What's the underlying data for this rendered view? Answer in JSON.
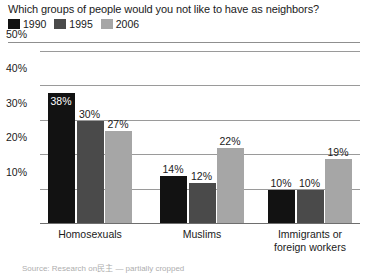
{
  "title": "Which groups of people would you not like to have as neighbors?",
  "legend": {
    "items": [
      {
        "label": "1990",
        "color": "#121212"
      },
      {
        "label": "1995",
        "color": "#4a4a4a"
      },
      {
        "label": "2006",
        "color": "#a6a6a6"
      }
    ]
  },
  "source_note": "Source: Research on民主 — partially cropped",
  "chart_data": {
    "type": "bar",
    "title": "Which groups of people would you not like to have as neighbors?",
    "xlabel": "",
    "ylabel": "",
    "ylim": [
      0,
      50
    ],
    "ytick_labels": [
      "10%",
      "20%",
      "30%",
      "40%",
      "50%"
    ],
    "ytick_values": [
      10,
      20,
      30,
      40,
      50
    ],
    "grid": true,
    "legend_position": "top-left",
    "categories": [
      "Homosexuals",
      "Muslims",
      "Immigrants or foreign workers"
    ],
    "series": [
      {
        "name": "1990",
        "color": "#121212",
        "values": [
          38,
          14,
          10
        ],
        "labels": [
          "38%",
          "14%",
          "10%"
        ]
      },
      {
        "name": "1995",
        "color": "#4a4a4a",
        "values": [
          30,
          12,
          10
        ],
        "labels": [
          "30%",
          "12%",
          "10%"
        ]
      },
      {
        "name": "2006",
        "color": "#a6a6a6",
        "values": [
          27,
          22,
          19
        ],
        "labels": [
          "27%",
          "22%",
          "19%"
        ]
      }
    ]
  }
}
